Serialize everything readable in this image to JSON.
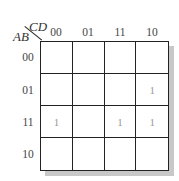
{
  "kmap": {
    "col_var": "CD",
    "row_var": "AB",
    "col_labels": [
      "00",
      "01",
      "11",
      "10"
    ],
    "row_labels": [
      "00",
      "01",
      "11",
      "10"
    ],
    "cells": [
      [
        "",
        "",
        "",
        ""
      ],
      [
        "",
        "",
        "",
        "1"
      ],
      [
        "1",
        "",
        "1",
        "1"
      ],
      [
        "",
        "",
        "",
        ""
      ]
    ]
  }
}
